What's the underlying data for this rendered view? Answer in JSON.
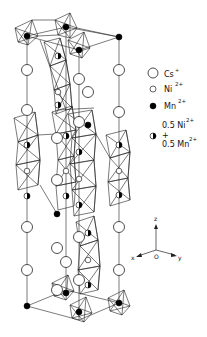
{
  "legend": {
    "items": [
      {
        "symbol": "open-large-circle",
        "label": "Cs",
        "charge": "+"
      },
      {
        "symbol": "open-small-circle",
        "label": "Ni",
        "charge": "2+"
      },
      {
        "symbol": "filled-circle",
        "label": "Mn",
        "charge": "2+"
      },
      {
        "symbol": "half-filled-circle",
        "label_line1": "0.5 Ni",
        "charge1": "2+",
        "plus": "+",
        "label_line2": "0.5 Mn",
        "charge2": "2+"
      }
    ]
  },
  "axes": {
    "z": "z",
    "x": "x",
    "y": "y",
    "origin": "O"
  },
  "colors": {
    "line": "#222222",
    "fill_dark": "#000000",
    "background": "#ffffff"
  }
}
